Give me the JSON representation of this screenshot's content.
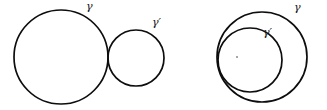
{
  "figure": {
    "title": "",
    "background_color": "#ffffff",
    "stroke_color": "#0d0d0d",
    "width": 327,
    "height": 110,
    "panels": [
      {
        "name": "externally-tangent-circles",
        "description": "Two circles tangent externally",
        "labels": [
          {
            "name": "gamma",
            "text": "γ",
            "x": 86,
            "y": 1
          },
          {
            "name": "gamma-prime",
            "text": "γ′",
            "x": 152,
            "y": 17
          }
        ],
        "circles": [
          {
            "name": "outer-large-circle",
            "label": "γ",
            "cx": 61,
            "cy": 57,
            "r": 47
          },
          {
            "name": "small-circle",
            "label": "γ′",
            "cx": 136,
            "cy": 58,
            "r": 28
          }
        ]
      },
      {
        "name": "internally-tangent-circles",
        "description": "Two circles tangent internally",
        "labels": [
          {
            "name": "gamma",
            "text": "γ",
            "x": 294,
            "y": 2
          },
          {
            "name": "gamma-prime",
            "text": "γ′",
            "x": 263,
            "y": 27
          }
        ],
        "circles": [
          {
            "name": "outer-circle",
            "label": "γ",
            "cx": 262,
            "cy": 57,
            "r": 45
          },
          {
            "name": "inner-circle",
            "label": "γ′",
            "cx": 250,
            "cy": 60,
            "r": 32
          }
        ],
        "marks": [
          {
            "name": "interior-point-dot",
            "x": 237,
            "y": 57,
            "r": 1
          }
        ]
      }
    ]
  }
}
